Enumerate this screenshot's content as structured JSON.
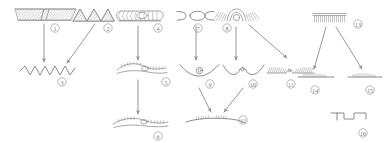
{
  "figure": {
    "kind": "hand-drawn-sketch-flow-diagram",
    "background_color": "#ffffff",
    "ink_color": "#8a8a8a",
    "label_color": "#7d7d7d",
    "width": 386,
    "height": 143,
    "node_count": 16,
    "arrow_count": 12
  },
  "nodes": [
    {
      "id": 1,
      "label": "1",
      "label_x": 55,
      "label_y": 28,
      "shape": "hatched-flat-band-pair",
      "description": "two adjoining densely hatched flat bands",
      "x": 14,
      "y": 8,
      "w": 62,
      "h": 13
    },
    {
      "id": 2,
      "label": "2",
      "label_x": 108,
      "label_y": 28,
      "shape": "hatched-zigzag-band",
      "description": "hatched band folded into chevron zigzag peaks",
      "x": 72,
      "y": 8,
      "w": 42,
      "h": 14
    },
    {
      "id": 3,
      "label": "3",
      "label_x": 62,
      "label_y": 82,
      "shape": "zigzag-line",
      "description": "plain sawtooth zigzag line",
      "x": 20,
      "y": 66,
      "w": 56,
      "h": 11
    },
    {
      "id": 4,
      "label": "4",
      "label_x": 158,
      "label_y": 28,
      "shape": "coiled-tube",
      "description": "horizontal coil / ribbed tube with rounded ends",
      "x": 116,
      "y": 10,
      "w": 48,
      "h": 12
    },
    {
      "id": 5,
      "label": "5",
      "label_x": 166,
      "label_y": 82,
      "shape": "curved-hatched-layers",
      "description": "two overlapping curved layers with short hatching",
      "x": 116,
      "y": 62,
      "w": 52,
      "h": 14
    },
    {
      "id": 6,
      "label": "6",
      "label_x": 158,
      "label_y": 136,
      "shape": "curved-hatched-layers-merged",
      "description": "long curved layer with hatching merged at centre",
      "x": 112,
      "y": 118,
      "w": 56,
      "h": 13
    },
    {
      "id": 7,
      "label": "7",
      "label_x": 198,
      "label_y": 28,
      "shape": "bracket-lens-bracket",
      "description": "open bracket, lens, open bracket triplet",
      "x": 176,
      "y": 11,
      "w": 38,
      "h": 10
    },
    {
      "id": 8,
      "label": "8",
      "label_x": 227,
      "label_y": 28,
      "shape": "radiating-fan-arc",
      "description": "nested arcs with radiating fine rays on both sides",
      "x": 214,
      "y": 8,
      "w": 46,
      "h": 14
    },
    {
      "id": 9,
      "label": "9",
      "label_x": 210,
      "label_y": 84,
      "shape": "draped-line-with-bead",
      "description": "drooping curved line with small ringed bead at apex",
      "x": 180,
      "y": 62,
      "w": 42,
      "h": 15
    },
    {
      "id": 10,
      "label": "10",
      "label_x": 253,
      "label_y": 84,
      "shape": "wave-line-with-bump",
      "description": "wavy line with central raised bump containing dot",
      "x": 222,
      "y": 62,
      "w": 44,
      "h": 15
    },
    {
      "id": 11,
      "label": "11",
      "label_x": 291,
      "label_y": 84,
      "shape": "hatched-flat-band-with-gap",
      "description": "flat hatched band split by a small central bump",
      "x": 266,
      "y": 65,
      "w": 48,
      "h": 11
    },
    {
      "id": 12,
      "label": "12",
      "label_x": 243,
      "label_y": 120,
      "shape": "hatched-long-line-with-gap",
      "description": "long shallow curved line with two hatched patches",
      "x": 186,
      "y": 116,
      "w": 58,
      "h": 10
    },
    {
      "id": 13,
      "label": "13",
      "label_x": 358,
      "label_y": 24,
      "shape": "comb-band",
      "description": "short straight band with dense comb teeth below",
      "x": 312,
      "y": 12,
      "w": 34,
      "h": 10
    },
    {
      "id": 14,
      "label": "14",
      "label_x": 315,
      "label_y": 90,
      "shape": "fine-comb-line-left",
      "description": "short horizontal line with fine teeth",
      "x": 298,
      "y": 72,
      "w": 36,
      "h": 8
    },
    {
      "id": 15,
      "label": "15",
      "label_x": 370,
      "label_y": 90,
      "shape": "fine-comb-line-right",
      "description": "short horizontal line with fine teeth",
      "x": 348,
      "y": 72,
      "w": 34,
      "h": 8
    },
    {
      "id": 16,
      "label": "16",
      "label_x": 363,
      "label_y": 133,
      "shape": "stepped-line",
      "description": "descending staircase / stepped offset line",
      "x": 330,
      "y": 112,
      "w": 36,
      "h": 14
    }
  ],
  "arrows": [
    {
      "id": "a1",
      "from": 1,
      "to": 3,
      "x1": 44,
      "y1": 24,
      "x2": 44,
      "y2": 62
    },
    {
      "id": "a2",
      "from": 2,
      "to": 3,
      "x1": 95,
      "y1": 24,
      "x2": 66,
      "y2": 64
    },
    {
      "id": "a3",
      "from": 4,
      "to": 5,
      "x1": 138,
      "y1": 26,
      "x2": 138,
      "y2": 60
    },
    {
      "id": "a4",
      "from": 5,
      "to": 6,
      "x1": 138,
      "y1": 80,
      "x2": 138,
      "y2": 114
    },
    {
      "id": "a5",
      "from": 7,
      "to": 9,
      "x1": 196,
      "y1": 26,
      "x2": 196,
      "y2": 60
    },
    {
      "id": "a6",
      "from": 8,
      "to": 10,
      "x1": 236,
      "y1": 26,
      "x2": 236,
      "y2": 60
    },
    {
      "id": "a7",
      "from": 8,
      "to": 11,
      "x1": 250,
      "y1": 25,
      "x2": 286,
      "y2": 58
    },
    {
      "id": "a8",
      "from": 9,
      "to": 12,
      "x1": 200,
      "y1": 86,
      "x2": 212,
      "y2": 112
    },
    {
      "id": "a9",
      "from": 10,
      "to": 12,
      "x1": 240,
      "y1": 86,
      "x2": 224,
      "y2": 112
    },
    {
      "id": "a10",
      "from": 13,
      "to": 14,
      "x1": 326,
      "y1": 26,
      "x2": 314,
      "y2": 68
    },
    {
      "id": "a11",
      "from": 13,
      "to": 15,
      "x1": 336,
      "y1": 26,
      "x2": 362,
      "y2": 68
    },
    {
      "id": "a12",
      "from": 0,
      "to": 0,
      "x1": 0,
      "y1": 0,
      "x2": 0,
      "y2": 0
    }
  ]
}
